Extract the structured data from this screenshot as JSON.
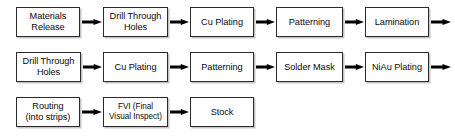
{
  "diagram": {
    "type": "flowchart",
    "orientation": "left-to-right, wrapped into three rows",
    "background_color": "#ffffff",
    "box_border_color": "#2b2b2b",
    "box_fill_color": "#ffffff",
    "arrow_color": "#000000",
    "rows": [
      {
        "row_index": 1,
        "nodes": [
          {
            "id": "materials-release",
            "label": "Materials\nRelease",
            "x": 16,
            "width": 64,
            "multiline": true
          },
          {
            "id": "drill-through-holes-1",
            "label": "Drill Through\nHoles",
            "x": 103,
            "width": 65,
            "multiline": true
          },
          {
            "id": "cu-plating-1",
            "label": "Cu Plating",
            "x": 190,
            "width": 64,
            "multiline": false
          },
          {
            "id": "patterning-1",
            "label": "Patterning",
            "x": 276,
            "width": 67,
            "multiline": false
          },
          {
            "id": "lamination",
            "label": "Lamination",
            "x": 365,
            "width": 64,
            "multiline": false
          }
        ],
        "connectors": [
          {
            "id": "arrow-r1-1",
            "x": 82,
            "width": 20,
            "from": "materials-release",
            "to": "drill-through-holes-1"
          },
          {
            "id": "arrow-r1-2",
            "x": 170,
            "width": 19,
            "from": "drill-through-holes-1",
            "to": "cu-plating-1"
          },
          {
            "id": "arrow-r1-3",
            "x": 256,
            "width": 19,
            "from": "cu-plating-1",
            "to": "patterning-1"
          },
          {
            "id": "arrow-r1-4",
            "x": 345,
            "width": 19,
            "from": "patterning-1",
            "to": "lamination"
          },
          {
            "id": "arrow-r1-wrap",
            "x": 431,
            "width": 20,
            "from": "lamination",
            "to": "next-row"
          }
        ]
      },
      {
        "row_index": 2,
        "nodes": [
          {
            "id": "drill-through-holes-2",
            "label": "Drill Through\nHoles",
            "x": 16,
            "width": 65,
            "multiline": true
          },
          {
            "id": "cu-plating-2",
            "label": "Cu Plating",
            "x": 103,
            "width": 65,
            "multiline": false
          },
          {
            "id": "patterning-2",
            "label": "Patterning",
            "x": 190,
            "width": 64,
            "multiline": false
          },
          {
            "id": "solder-mask",
            "label": "Solder Mask",
            "x": 276,
            "width": 67,
            "multiline": false
          },
          {
            "id": "niau-plating",
            "label": "NiAu Plating",
            "x": 365,
            "width": 64,
            "multiline": false
          }
        ],
        "connectors": [
          {
            "id": "arrow-r2-1",
            "x": 83,
            "width": 19,
            "from": "drill-through-holes-2",
            "to": "cu-plating-2"
          },
          {
            "id": "arrow-r2-2",
            "x": 170,
            "width": 19,
            "from": "cu-plating-2",
            "to": "patterning-2"
          },
          {
            "id": "arrow-r2-3",
            "x": 256,
            "width": 19,
            "from": "patterning-2",
            "to": "solder-mask"
          },
          {
            "id": "arrow-r2-4",
            "x": 345,
            "width": 19,
            "from": "solder-mask",
            "to": "niau-plating"
          },
          {
            "id": "arrow-r2-wrap",
            "x": 431,
            "width": 20,
            "from": "niau-plating",
            "to": "next-row"
          }
        ]
      },
      {
        "row_index": 3,
        "nodes": [
          {
            "id": "routing",
            "label": "Routing\n(into strips)",
            "x": 16,
            "width": 64,
            "multiline": true
          },
          {
            "id": "fvi",
            "label": "FVI (Final\nVisual Inspect)",
            "x": 103,
            "width": 65,
            "multiline": true,
            "small_text": true
          },
          {
            "id": "stock",
            "label": "Stock",
            "x": 190,
            "width": 64,
            "multiline": false
          }
        ],
        "connectors": [
          {
            "id": "arrow-r3-1",
            "x": 82,
            "width": 20,
            "from": "routing",
            "to": "fvi"
          },
          {
            "id": "arrow-r3-2",
            "x": 170,
            "width": 19,
            "from": "fvi",
            "to": "stock"
          }
        ]
      }
    ],
    "process_sequence": [
      "Materials Release",
      "Drill Through Holes",
      "Cu Plating",
      "Patterning",
      "Lamination",
      "Drill Through Holes",
      "Cu Plating",
      "Patterning",
      "Solder Mask",
      "NiAu Plating",
      "Routing (into strips)",
      "FVI (Final Visual Inspect)",
      "Stock"
    ]
  }
}
